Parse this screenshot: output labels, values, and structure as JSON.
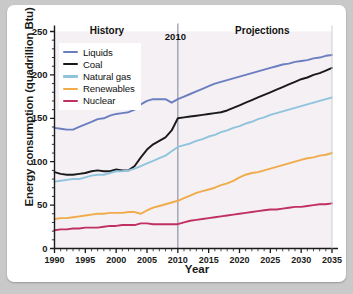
{
  "chart_data": {
    "type": "line",
    "title": "",
    "xlabel": "Year",
    "ylabel": "Energy consumption (quadrillion Btu)",
    "xlim": [
      1990,
      2035
    ],
    "ylim": [
      0,
      250
    ],
    "yticks": [
      0,
      50,
      100,
      150,
      200,
      250
    ],
    "xticks": [
      1990,
      1995,
      2000,
      2005,
      2010,
      2015,
      2020,
      2025,
      2030,
      2035
    ],
    "x_minor_tick_step": 1,
    "grid": false,
    "legend_position": "top-left inside plot",
    "annotations": [
      {
        "text": "History",
        "x": 1998.5,
        "y": 247,
        "name": "history-label"
      },
      {
        "text": "Projections",
        "x": 2023.5,
        "y": 247,
        "name": "projections-label"
      },
      {
        "text": "2010",
        "x": 2010,
        "y": 240,
        "name": "divider-year-label"
      }
    ],
    "divider": {
      "x": 2010,
      "color": "#9b9bab",
      "label": "2010"
    },
    "x": [
      1990,
      1991,
      1992,
      1993,
      1994,
      1995,
      1996,
      1997,
      1998,
      1999,
      2000,
      2001,
      2002,
      2003,
      2004,
      2005,
      2006,
      2007,
      2008,
      2009,
      2010,
      2011,
      2012,
      2013,
      2014,
      2015,
      2016,
      2017,
      2018,
      2019,
      2020,
      2021,
      2022,
      2023,
      2024,
      2025,
      2026,
      2027,
      2028,
      2029,
      2030,
      2031,
      2032,
      2033,
      2034,
      2035
    ],
    "series": [
      {
        "name": "Liquids",
        "color": "#6b7fc0",
        "values": [
          139,
          138,
          137,
          137,
          140,
          143,
          146,
          149,
          150,
          153,
          155,
          156,
          157,
          160,
          166,
          170,
          172,
          172,
          172,
          168,
          172,
          175,
          178,
          181,
          184,
          187,
          190,
          192,
          194,
          196,
          198,
          200,
          202,
          204,
          206,
          208,
          210,
          212,
          213,
          215,
          216,
          217,
          219,
          220,
          222,
          223
        ]
      },
      {
        "name": "Coal",
        "color": "#1a1a1a",
        "values": [
          88,
          86,
          85,
          85,
          86,
          87,
          89,
          90,
          89,
          89,
          91,
          90,
          90,
          95,
          105,
          114,
          120,
          124,
          128,
          136,
          150,
          151,
          152,
          153,
          154,
          155,
          156,
          157,
          159,
          162,
          165,
          168,
          171,
          174,
          177,
          180,
          183,
          186,
          189,
          192,
          195,
          197,
          200,
          202,
          205,
          208
        ]
      },
      {
        "name": "Natural gas",
        "color": "#8fc4dc",
        "values": [
          77,
          78,
          79,
          80,
          80,
          82,
          84,
          85,
          85,
          87,
          89,
          89,
          90,
          92,
          95,
          98,
          101,
          104,
          107,
          112,
          117,
          119,
          121,
          124,
          126,
          129,
          131,
          134,
          136,
          139,
          141,
          144,
          146,
          149,
          151,
          154,
          156,
          158,
          160,
          162,
          164,
          166,
          168,
          170,
          172,
          174
        ]
      },
      {
        "name": "Renewables",
        "color": "#f0ab4a",
        "values": [
          34,
          35,
          35,
          36,
          37,
          38,
          39,
          40,
          40,
          41,
          41,
          41,
          42,
          42,
          40,
          44,
          47,
          49,
          51,
          53,
          55,
          58,
          61,
          64,
          66,
          68,
          70,
          73,
          75,
          78,
          82,
          85,
          87,
          88,
          90,
          92,
          94,
          96,
          98,
          100,
          102,
          104,
          105,
          107,
          108,
          110
        ]
      },
      {
        "name": "Nuclear",
        "color": "#c03060",
        "values": [
          21,
          22,
          22,
          23,
          23,
          24,
          24,
          24,
          25,
          26,
          26,
          27,
          27,
          27,
          29,
          29,
          28,
          28,
          28,
          28,
          28,
          30,
          32,
          33,
          34,
          35,
          36,
          37,
          38,
          39,
          40,
          41,
          42,
          43,
          44,
          45,
          45,
          46,
          47,
          48,
          48,
          49,
          50,
          51,
          51,
          52
        ]
      }
    ]
  },
  "legend": {
    "items": [
      {
        "label": "Liquids",
        "color": "#6b7fc0"
      },
      {
        "label": "Coal",
        "color": "#1a1a1a"
      },
      {
        "label": "Natural gas",
        "color": "#8fc4dc"
      },
      {
        "label": "Renewables",
        "color": "#f0ab4a"
      },
      {
        "label": "Nuclear",
        "color": "#c03060"
      }
    ]
  },
  "style": {
    "plot_background": "#f4f0f4",
    "card_background": "#ffffff",
    "page_background": "#c9c9c9",
    "axis_color": "#1a1a1a"
  }
}
